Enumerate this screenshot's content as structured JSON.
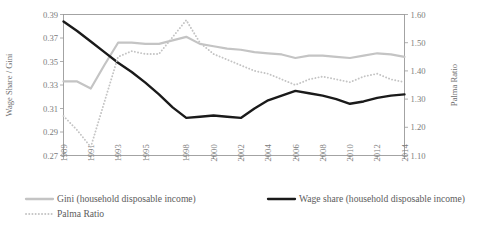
{
  "chart_data": {
    "type": "line",
    "title": "",
    "xlabel": "",
    "ylabel": "Wage Share / Gini",
    "y2label": "Palma Ratio",
    "grid": false,
    "legend_position": "bottom",
    "x": [
      1989,
      1990,
      1991,
      1992,
      1993,
      1994,
      1995,
      1996,
      1997,
      1998,
      1999,
      2000,
      2001,
      2002,
      2003,
      2004,
      2005,
      2006,
      2007,
      2008,
      2009,
      2010,
      2011,
      2012,
      2013,
      2014
    ],
    "xtick_labels": [
      "1989",
      "1991",
      "1993",
      "1995",
      "1998",
      "2000",
      "2002",
      "2004",
      "2006",
      "2008",
      "2010",
      "2012",
      "2014"
    ],
    "ylim": [
      0.27,
      0.39
    ],
    "ytick_labels": [
      "0.27",
      "0.29",
      "0.31",
      "0.33",
      "0.35",
      "0.37",
      "0.39"
    ],
    "ytick_values": [
      0.27,
      0.29,
      0.31,
      0.33,
      0.35,
      0.37,
      0.39
    ],
    "y2lim": [
      1.1,
      1.6
    ],
    "y2tick_labels": [
      "1.10",
      "1.20",
      "1.30",
      "1.40",
      "1.50",
      "1.60"
    ],
    "y2tick_values": [
      1.1,
      1.2,
      1.3,
      1.4,
      1.5,
      1.6
    ],
    "series": [
      {
        "name": "Gini (household disposable income)",
        "axis": "left",
        "style": "solid",
        "color": "#c4c4c4",
        "width": 2.2,
        "values": [
          0.333,
          0.333,
          0.327,
          0.347,
          0.366,
          0.366,
          0.365,
          0.365,
          0.368,
          0.371,
          0.365,
          0.363,
          0.361,
          0.36,
          0.358,
          0.357,
          0.356,
          0.353,
          0.355,
          0.355,
          0.354,
          0.353,
          0.355,
          0.357,
          0.356,
          0.354
        ]
      },
      {
        "name": "Wage share (household disposable income)",
        "axis": "left",
        "style": "solid",
        "color": "#1a1a1a",
        "width": 2.4,
        "values": [
          0.384,
          0.376,
          0.367,
          0.358,
          0.349,
          0.341,
          0.332,
          0.322,
          0.311,
          0.302,
          0.303,
          0.304,
          0.303,
          0.302,
          0.31,
          0.317,
          0.321,
          0.325,
          0.323,
          0.321,
          0.318,
          0.314,
          0.316,
          0.319,
          0.321,
          0.322
        ]
      },
      {
        "name": "Palma Ratio",
        "axis": "right",
        "style": "dotted",
        "color": "#c4c4c4",
        "width": 1.9,
        "values": [
          1.24,
          1.19,
          1.13,
          1.29,
          1.45,
          1.47,
          1.46,
          1.46,
          1.52,
          1.58,
          1.5,
          1.46,
          1.44,
          1.42,
          1.4,
          1.39,
          1.37,
          1.35,
          1.37,
          1.38,
          1.37,
          1.36,
          1.38,
          1.39,
          1.37,
          1.36
        ]
      }
    ]
  },
  "legend": {
    "items": [
      {
        "label": "Gini (household disposable income)",
        "color": "#c4c4c4",
        "style": "solid"
      },
      {
        "label": "Wage share (household disposable income)",
        "color": "#1a1a1a",
        "style": "solid"
      },
      {
        "label": "Palma Ratio",
        "color": "#c4c4c4",
        "style": "dotted"
      }
    ]
  }
}
